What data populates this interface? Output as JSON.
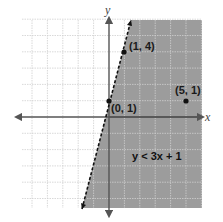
{
  "chart_data": {
    "type": "scatter",
    "title": "",
    "xlabel": "x",
    "ylabel": "y",
    "xlim": [
      -5.5,
      6
    ],
    "ylim": [
      -5.8,
      6
    ],
    "grid": true,
    "inequality": {
      "label": "y < 3x + 1",
      "boundary": {
        "slope": 3,
        "intercept": 1,
        "style": "dashed"
      },
      "shaded_side": "right/below"
    },
    "points": [
      {
        "x": 0,
        "y": 1,
        "label": "(0, 1)"
      },
      {
        "x": 1,
        "y": 4,
        "label": "(1, 4)"
      },
      {
        "x": 5,
        "y": 1,
        "label": "(5, 1)"
      }
    ]
  },
  "labels": {
    "x_axis": "x",
    "y_axis": "y",
    "inequality": "y < 3x + 1",
    "p0": "(0, 1)",
    "p1": "(1, 4)",
    "p2": "(5, 1)"
  },
  "colors": {
    "shade": "#9c9c9c",
    "grid": "#cfcfcf",
    "axis": "#555555",
    "line": "#111111"
  }
}
